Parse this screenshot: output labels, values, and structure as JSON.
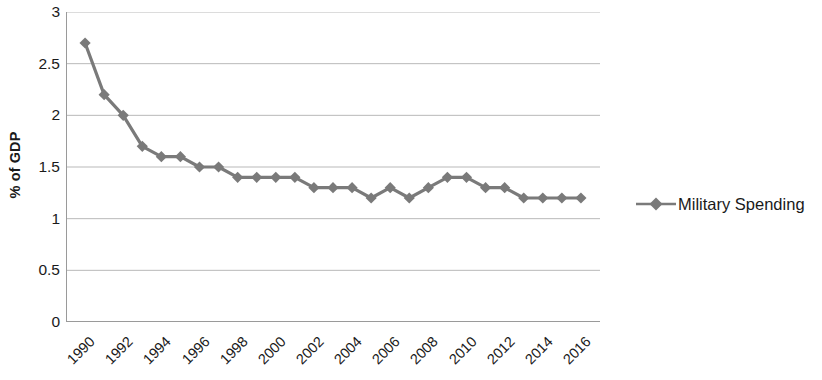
{
  "chart_data": {
    "type": "line",
    "title": "",
    "xlabel": "",
    "ylabel": "% of GDP",
    "ylim": [
      0,
      3
    ],
    "ytick_step": 0.5,
    "yticks": [
      "0",
      "0.5",
      "1",
      "1.5",
      "2",
      "2.5",
      "3"
    ],
    "grid": true,
    "legend_position": "right",
    "x": [
      1990,
      1991,
      1992,
      1993,
      1994,
      1995,
      1996,
      1997,
      1998,
      1999,
      2000,
      2001,
      2002,
      2003,
      2004,
      2005,
      2006,
      2007,
      2008,
      2009,
      2010,
      2011,
      2012,
      2013,
      2014,
      2015,
      2016
    ],
    "xtick_labels": [
      "1990",
      "1992",
      "1994",
      "1996",
      "1998",
      "2000",
      "2002",
      "2004",
      "2006",
      "2008",
      "2010",
      "2012",
      "2014",
      "2016"
    ],
    "series": [
      {
        "name": "Military Spending",
        "color": "#7a7a7a",
        "marker": "diamond",
        "values": [
          2.7,
          2.2,
          2.0,
          1.7,
          1.6,
          1.6,
          1.5,
          1.5,
          1.4,
          1.4,
          1.4,
          1.4,
          1.3,
          1.3,
          1.3,
          1.2,
          1.3,
          1.2,
          1.3,
          1.4,
          1.4,
          1.3,
          1.3,
          1.2,
          1.2,
          1.2,
          1.2
        ]
      }
    ]
  },
  "legend": {
    "entries": [
      {
        "label": "Military Spending"
      }
    ]
  },
  "axes": {
    "y_title": "% of GDP"
  },
  "colors": {
    "series": "#7a7a7a",
    "gridline": "#b9b9b9",
    "axis": "#9a9a9a",
    "text": "#1a1a1a"
  }
}
